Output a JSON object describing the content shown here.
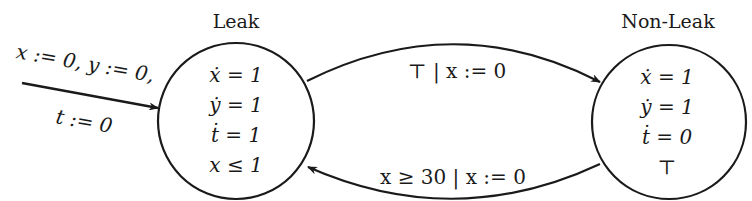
{
  "diagram": {
    "type": "hybrid-automaton",
    "states": [
      {
        "id": "leak",
        "name": "Leak",
        "lines": [
          "ẋ = 1",
          "ẏ = 1",
          "ṫ = 1",
          "x ≤ 1"
        ]
      },
      {
        "id": "non-leak",
        "name": "Non-Leak",
        "lines": [
          "ẋ = 1",
          "ẏ = 1",
          "ṫ = 0",
          "⊤"
        ]
      }
    ],
    "initial": {
      "label_line1": "x := 0, y := 0,",
      "label_line2": "t := 0"
    },
    "transitions": [
      {
        "from": "leak",
        "to": "non-leak",
        "label": "⊤ | x := 0"
      },
      {
        "from": "non-leak",
        "to": "leak",
        "label": "x ≥ 30 | x := 0"
      }
    ],
    "colors": {
      "stroke": "#1a1a1a",
      "background": "#ffffff"
    }
  }
}
